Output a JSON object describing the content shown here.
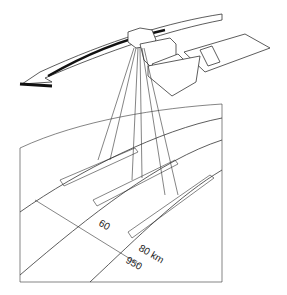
{
  "diagram": {
    "labels": {
      "beam_width": "60",
      "swath_spacing": "80 km",
      "ground_distance": "950"
    },
    "colors": {
      "line": "#333333",
      "arrow_fill": "#ffffff",
      "arrow_shadow": "#111111",
      "background": "#ffffff"
    }
  }
}
